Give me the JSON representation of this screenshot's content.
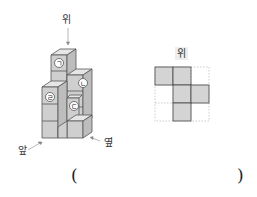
{
  "figure": {
    "view_labels": {
      "top": "위",
      "front": "앞",
      "side": "옆"
    },
    "block_markers": [
      "ㄱ",
      "ㄴ",
      "ㄷ",
      "ㄹ"
    ],
    "colors": {
      "cube_top": "#e6e6e6",
      "cube_front": "#cfcfcf",
      "cube_side": "#bdbdbd",
      "stroke": "#555555",
      "grid_fill": "#d4d4d4",
      "grid_dash": "#aaaaaa"
    }
  },
  "top_view": {
    "label": "위",
    "grid_rows": 3,
    "grid_cols": 3,
    "filled_cells": [
      [
        0,
        0
      ],
      [
        0,
        1
      ],
      [
        1,
        1
      ],
      [
        1,
        2
      ],
      [
        2,
        1
      ]
    ]
  },
  "answer": {
    "open_paren": "(",
    "close_paren": ")",
    "value": ""
  }
}
